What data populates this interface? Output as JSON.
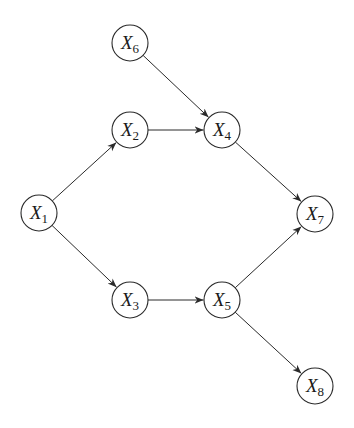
{
  "diagram": {
    "type": "directed-acyclic-graph",
    "colors": {
      "stroke": "#2a2a2a",
      "background": "#ffffff",
      "node_fill": "#ffffff"
    },
    "node_radius": 18,
    "nodes": [
      {
        "id": "X1",
        "base": "X",
        "sub": "1",
        "x": 39,
        "y": 213
      },
      {
        "id": "X2",
        "base": "X",
        "sub": "2",
        "x": 130,
        "y": 130
      },
      {
        "id": "X3",
        "base": "X",
        "sub": "3",
        "x": 130,
        "y": 300
      },
      {
        "id": "X4",
        "base": "X",
        "sub": "4",
        "x": 222,
        "y": 130
      },
      {
        "id": "X5",
        "base": "X",
        "sub": "5",
        "x": 222,
        "y": 300
      },
      {
        "id": "X6",
        "base": "X",
        "sub": "6",
        "x": 130,
        "y": 43
      },
      {
        "id": "X7",
        "base": "X",
        "sub": "7",
        "x": 315,
        "y": 214
      },
      {
        "id": "X8",
        "base": "X",
        "sub": "8",
        "x": 315,
        "y": 386
      }
    ],
    "edges": [
      {
        "from": "X1",
        "to": "X2"
      },
      {
        "from": "X1",
        "to": "X3"
      },
      {
        "from": "X2",
        "to": "X4"
      },
      {
        "from": "X6",
        "to": "X4"
      },
      {
        "from": "X3",
        "to": "X5"
      },
      {
        "from": "X4",
        "to": "X7"
      },
      {
        "from": "X5",
        "to": "X7"
      },
      {
        "from": "X5",
        "to": "X8"
      }
    ]
  }
}
